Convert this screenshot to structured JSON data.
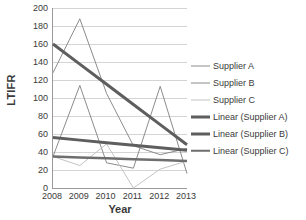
{
  "chart_data": {
    "type": "line",
    "title": "",
    "xlabel": "Year",
    "ylabel": "LTIFR",
    "categories": [
      "2008",
      "2009",
      "2010",
      "2011",
      "2012",
      "2013"
    ],
    "x": [
      2008,
      2009,
      2010,
      2011,
      2012,
      2013
    ],
    "ylim": [
      0,
      200
    ],
    "yticks": [
      0,
      20,
      40,
      60,
      80,
      100,
      120,
      140,
      160,
      180,
      200
    ],
    "ytick_labels": [
      "0",
      "20",
      "40",
      "60",
      "80",
      "100",
      "120",
      "140",
      "160",
      "180",
      "200"
    ],
    "grid": true,
    "legend_position": "right",
    "series": [
      {
        "name": "Supplier A",
        "kind": "data",
        "color": "#8c8c8c",
        "width": 1,
        "values": [
          128,
          188,
          105,
          47,
          37,
          44
        ]
      },
      {
        "name": "Supplier B",
        "kind": "data",
        "color": "#8c8c8c",
        "width": 1,
        "values": [
          35,
          114,
          28,
          22,
          113,
          16
        ]
      },
      {
        "name": "Supplier C",
        "kind": "data",
        "color": "#c4c4c4",
        "width": 1,
        "values": [
          35,
          25,
          49,
          0,
          21,
          30
        ]
      },
      {
        "name": "Linear (Supplier A)",
        "kind": "trend",
        "color": "#5e5e5e",
        "width": 3,
        "values": [
          160,
          137.6,
          115.2,
          92.8,
          70.4,
          48
        ]
      },
      {
        "name": "Linear (Supplier B)",
        "kind": "trend",
        "color": "#5e5e5e",
        "width": 3,
        "values": [
          56,
          53.2,
          50.4,
          47.6,
          44.8,
          42
        ]
      },
      {
        "name": "Linear (Supplier C)",
        "kind": "trend",
        "color": "#6e6e6e",
        "width": 2.5,
        "values": [
          35,
          34,
          33,
          32,
          31,
          30
        ]
      }
    ],
    "legend_entries": [
      {
        "label": "Supplier A",
        "color": "#8c8c8c",
        "thickness": 1
      },
      {
        "label": "Supplier B",
        "color": "#8c8c8c",
        "thickness": 1
      },
      {
        "label": "Supplier C",
        "color": "#c4c4c4",
        "thickness": 1
      },
      {
        "label": "Linear (Supplier A)",
        "color": "#5e5e5e",
        "thickness": 3
      },
      {
        "label": "Linear (Supplier B)",
        "color": "#5e5e5e",
        "thickness": 3
      },
      {
        "label": "Linear (Supplier C)",
        "color": "#6e6e6e",
        "thickness": 2.5
      }
    ],
    "colors": {
      "axis": "#9a9a9a",
      "grid": "#d4d4d4",
      "text": "#3a3a3a",
      "background": "#ffffff"
    }
  }
}
